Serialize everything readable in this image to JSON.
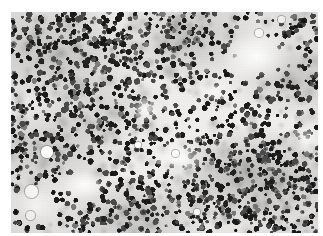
{
  "image": {
    "kind": "photomicrograph",
    "title": "Histopathology photomicrograph",
    "description": "Grayscale photomicrograph of a hypercellular bone marrow aspirate showing a dense, diffuse sheet of small round darkly stained nuclei separated by pale interstitial spaces and clear round fat vacuoles.",
    "modality": "light-microscopy",
    "stain": "hematoxylin",
    "color_mode": "grayscale",
    "width_px": 323,
    "height_px": 236,
    "border": {
      "top_px": 12,
      "left_px": 11,
      "right_px": 5,
      "bottom_px": 3,
      "color": "#ffffff"
    },
    "field": {
      "x_px": 11,
      "y_px": 12,
      "width_px": 307,
      "height_px": 221
    },
    "palette": {
      "paper": "#ffffff",
      "background_pale": "#f4f3f1",
      "background_mid": "#d2d1cd",
      "background_dense": "#b4b3af",
      "nucleus_dark": "#1c1c1c",
      "nucleus_mid": "#4a4a4a",
      "nucleus_light": "#7d7d7d",
      "vacuole": "#fdfdfb"
    },
    "content": {
      "cell_count_rendered": 1450,
      "nucleus_diameter_px": [
        3.0,
        6.5
      ],
      "cell_shape": "round",
      "distribution": "dense diffuse sheet with patchy pale clearings"
    },
    "clear_spaces": [
      {
        "name": "upper-right-clearing",
        "cx_pct": 80,
        "cy_pct": 20
      },
      {
        "name": "central-clearing",
        "cx_pct": 55,
        "cy_pct": 66
      },
      {
        "name": "lower-left-clearing",
        "cx_pct": 24,
        "cy_pct": 78
      },
      {
        "name": "bottom-left-clearing",
        "cx_pct": 8,
        "cy_pct": 88
      }
    ],
    "fat_vacuoles": [
      {
        "name": "fat-vacuole-1",
        "cx_px": 47,
        "cy_px": 152,
        "d_px": 12
      },
      {
        "name": "fat-vacuole-2",
        "cx_px": 31,
        "cy_px": 191,
        "d_px": 13
      },
      {
        "name": "fat-vacuole-3",
        "cx_px": 30,
        "cy_px": 215,
        "d_px": 9
      },
      {
        "name": "fat-vacuole-4",
        "cx_px": 259,
        "cy_px": 33,
        "d_px": 8
      },
      {
        "name": "fat-vacuole-5",
        "cx_px": 175,
        "cy_px": 153,
        "d_px": 7
      },
      {
        "name": "fat-vacuole-6",
        "cx_px": 138,
        "cy_px": 145,
        "d_px": 6
      },
      {
        "name": "fat-vacuole-7",
        "cx_px": 281,
        "cy_px": 19,
        "d_px": 7
      },
      {
        "name": "fat-vacuole-8",
        "cx_px": 197,
        "cy_px": 212,
        "d_px": 6
      }
    ]
  }
}
